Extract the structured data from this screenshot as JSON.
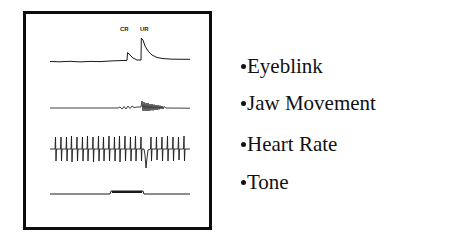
{
  "figure": {
    "trace_labels": {
      "cr": "CR",
      "ur": "UR"
    },
    "traces": [
      {
        "id": "eyeblink",
        "description": "Eyeblink trace with conditioned response (CR) bump and unconditioned response (UR) spike"
      },
      {
        "id": "jaw",
        "description": "Jaw movement trace with small wiggles then oscillation burst"
      },
      {
        "id": "heart",
        "description": "Heart rate trace with regular spikes"
      },
      {
        "id": "tone",
        "description": "Tone trace with rectangular step during tone presentation"
      }
    ]
  },
  "legend": {
    "items": [
      {
        "label": "Eyeblink"
      },
      {
        "label": "Jaw Movement"
      },
      {
        "label": "Heart Rate"
      },
      {
        "label": "Tone"
      }
    ]
  },
  "colors": {
    "ink": "#111111",
    "background": "#ffffff"
  }
}
